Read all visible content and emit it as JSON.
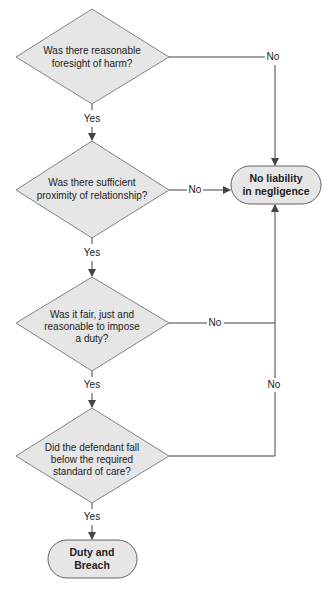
{
  "nodes": {
    "q1": {
      "type": "decision",
      "lines": [
        "Was there reasonable",
        "foresight of harm?"
      ]
    },
    "q2": {
      "type": "decision",
      "lines": [
        "Was there sufficient",
        "proximity of relationship?"
      ]
    },
    "q3": {
      "type": "decision",
      "lines": [
        "Was it fair, just and",
        "reasonable to impose",
        "a duty?"
      ]
    },
    "q4": {
      "type": "decision",
      "lines": [
        "Did the defendant fall",
        "below the required",
        "standard of care?"
      ]
    },
    "no_liability": {
      "type": "terminal",
      "lines": [
        "No liability",
        "in negligence"
      ]
    },
    "duty_breach": {
      "type": "terminal",
      "lines": [
        "Duty and",
        "Breach"
      ]
    }
  },
  "edges": {
    "q1_yes": "Yes",
    "q1_no": "No",
    "q2_yes": "Yes",
    "q2_no": "No",
    "q3_yes": "Yes",
    "q3_no": "No",
    "q4_yes": "Yes",
    "q4_no": "No"
  },
  "colors": {
    "shape_fill": "#e6e6e6",
    "stroke": "#555555",
    "text": "#222222"
  }
}
